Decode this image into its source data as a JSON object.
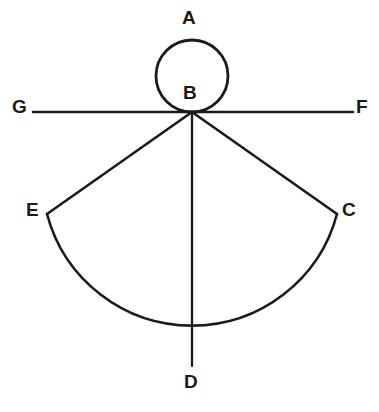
{
  "figure": {
    "stroke_color": "#1a1a1a",
    "background_color": "#ffffff",
    "labels": {
      "A": "A",
      "B": "B",
      "C": "C",
      "D": "D",
      "E": "E",
      "F": "F",
      "G": "G"
    },
    "points": {
      "A": {
        "x": 192,
        "y": 40
      },
      "B": {
        "x": 192,
        "y": 112
      },
      "C": {
        "x": 337,
        "y": 214
      },
      "D": {
        "x": 192,
        "y": 367
      },
      "E": {
        "x": 47,
        "y": 214
      },
      "F": {
        "x": 353,
        "y": 112
      },
      "G": {
        "x": 33,
        "y": 112
      }
    },
    "circle": {
      "center_x": 192,
      "center_y": 76,
      "radius": 36
    },
    "sector": {
      "apex_x": 192,
      "apex_y": 112,
      "arc_center_x": 192,
      "arc_center_y": 216,
      "arc_radius": 150,
      "left_arm_end_x": 47,
      "left_arm_end_y": 214,
      "right_arm_end_x": 337,
      "right_arm_end_y": 214,
      "median_end_x": 192,
      "median_end_y": 366
    },
    "line_gf": {
      "x1": 33,
      "y1": 112,
      "x2": 353,
      "y2": 112
    }
  }
}
